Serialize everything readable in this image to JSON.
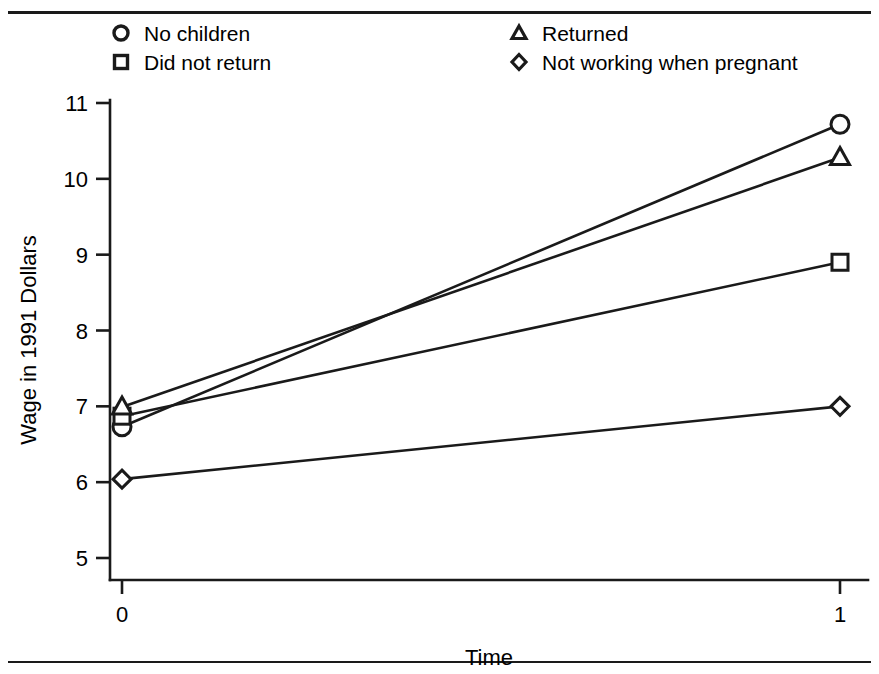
{
  "figure": {
    "width": 879,
    "height": 674,
    "background": "#ffffff",
    "ink_color": "#1a1a1a"
  },
  "chart_data": {
    "type": "line",
    "title": "",
    "subtitle": "",
    "xlabel": "Time",
    "ylabel": "Wage in 1991 Dollars",
    "x": [
      0,
      1
    ],
    "xticklabels": [
      "0",
      "1"
    ],
    "xlim": [
      0,
      1
    ],
    "ylim": [
      5,
      11
    ],
    "yticks": [
      5,
      6,
      7,
      8,
      9,
      10,
      11
    ],
    "yticklabels": [
      "5",
      "6",
      "7",
      "8",
      "9",
      "10",
      "11"
    ],
    "grid": false,
    "legend_position": "top",
    "series": [
      {
        "name": "No children",
        "marker": "circle",
        "values": [
          6.73,
          10.72
        ]
      },
      {
        "name": "Did not return",
        "marker": "square",
        "values": [
          6.87,
          8.9
        ]
      },
      {
        "name": "Returned",
        "marker": "triangle",
        "values": [
          6.99,
          10.28
        ]
      },
      {
        "name": "Not working when pregnant",
        "marker": "diamond",
        "values": [
          6.04,
          7.0
        ]
      }
    ]
  },
  "legend": {
    "items": [
      {
        "label": "No children",
        "marker": "circle"
      },
      {
        "label": "Did not return",
        "marker": "square"
      },
      {
        "label": "Returned",
        "marker": "triangle"
      },
      {
        "label": "Not working when pregnant",
        "marker": "diamond"
      }
    ]
  },
  "axes": {
    "y_title": "Wage in 1991 Dollars",
    "x_title": "Time",
    "y_labels": [
      "11",
      "10",
      "9",
      "8",
      "7",
      "6",
      "5"
    ],
    "x_labels": [
      "0",
      "1"
    ]
  }
}
